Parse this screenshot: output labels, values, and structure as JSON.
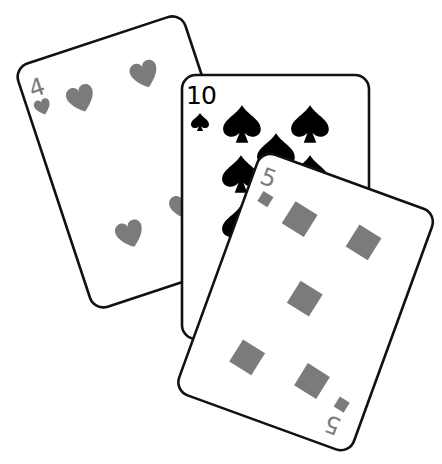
{
  "scene": {
    "description": "Three overlapping playing cards",
    "background": "#ffffff",
    "outline_color": "#111111"
  },
  "cards": [
    {
      "name": "four-of-hearts",
      "rank": "4",
      "suit": "hearts",
      "suit_icon": "heart-icon",
      "color": "#7b7b7b",
      "pips": 4
    },
    {
      "name": "ten-of-spades",
      "rank": "10",
      "suit": "spades",
      "suit_icon": "spade-icon",
      "color": "#000000",
      "pips": 10
    },
    {
      "name": "five-of-diamonds",
      "rank": "5",
      "rank_bottom": "5",
      "suit": "diamonds",
      "suit_icon": "diamond-icon",
      "color": "#7b7b7b",
      "pips": 5
    }
  ]
}
